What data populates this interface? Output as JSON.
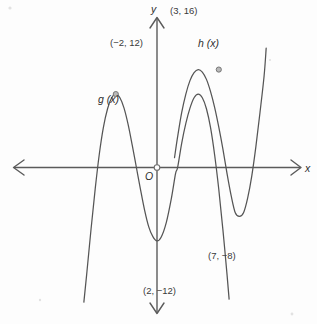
{
  "figure": {
    "kind": "cartesian-graph",
    "background_color": "#fdfdfd",
    "curve_color": "#555555",
    "axis_color": "#5b5b5b",
    "origin_label": "O",
    "x_axis_label": "x",
    "y_axis_label": "y"
  },
  "labels": {
    "g_function": "g (x)",
    "h_function": "h (x)",
    "g_max_point": "(−2, 12)",
    "h_max_point": "(3, 16)",
    "g_min_point": "(2, −12)",
    "h_min_point": "(7, −8)"
  },
  "chart_data": {
    "type": "line",
    "title": "",
    "xlabel": "x",
    "ylabel": "y",
    "grid": false,
    "legend": "inline-curve-labels",
    "xlim": [
      -6,
      10
    ],
    "ylim": [
      -24,
      24
    ],
    "origin_marker": "O",
    "annotations": [
      {
        "text": "(−2, 12)",
        "x": -2,
        "y": 12,
        "marker": true,
        "attached_to": "g (x)"
      },
      {
        "text": "(3, 16)",
        "x": 3,
        "y": 16,
        "marker": true,
        "attached_to": "h (x)"
      },
      {
        "text": "(2, −12)",
        "x": 2,
        "y": -12,
        "marker": false,
        "attached_to": "g (x)"
      },
      {
        "text": "(7, −8)",
        "x": 7,
        "y": -8,
        "marker": false,
        "attached_to": "h (x)"
      }
    ],
    "series": [
      {
        "name": "g (x)",
        "label_position": {
          "x": -4.2,
          "y": 7.5
        },
        "local_maximum": {
          "x": -2,
          "y": 12
        },
        "local_minimum": {
          "x": 2,
          "y": -12
        },
        "points": [
          [
            -3.55,
            -22.0
          ],
          [
            -3.4,
            -17.0
          ],
          [
            -3.2,
            -10.0
          ],
          [
            -3.0,
            -3.5
          ],
          [
            -2.8,
            2.2
          ],
          [
            -2.6,
            6.6
          ],
          [
            -2.4,
            9.6
          ],
          [
            -2.2,
            11.4
          ],
          [
            -2.0,
            12.0
          ],
          [
            -1.8,
            11.4
          ],
          [
            -1.6,
            9.7
          ],
          [
            -1.4,
            7.0
          ],
          [
            -1.2,
            3.6
          ],
          [
            -1.0,
            0.0
          ],
          [
            -0.8,
            -3.6
          ],
          [
            -0.6,
            -7.0
          ],
          [
            -0.4,
            -9.7
          ],
          [
            -0.2,
            -11.3
          ],
          [
            0.0,
            -12.0
          ],
          [
            0.2,
            -11.4
          ],
          [
            0.45,
            -9.0
          ],
          [
            0.7,
            -5.0
          ],
          [
            0.9,
            -1.0
          ],
          [
            1.0,
            0.0
          ],
          [
            1.2,
            4.0
          ],
          [
            1.4,
            7.2
          ],
          [
            1.6,
            9.7
          ],
          [
            1.8,
            11.4
          ],
          [
            2.0,
            12.0
          ],
          [
            2.2,
            11.4
          ],
          [
            2.4,
            9.6
          ],
          [
            2.6,
            6.5
          ],
          [
            2.8,
            2.0
          ],
          [
            3.0,
            -3.6
          ],
          [
            3.2,
            -10.2
          ],
          [
            3.4,
            -17.5
          ],
          [
            3.5,
            -21.5
          ]
        ]
      },
      {
        "name": "h (x)",
        "label_position": {
          "x": 4.4,
          "y": 18.5
        },
        "local_maximum": {
          "x": 3,
          "y": 16
        },
        "local_minimum": {
          "x": 7,
          "y": -8
        },
        "points": [
          [
            0.85,
            1.6
          ],
          [
            1.0,
            5.0
          ],
          [
            1.2,
            9.0
          ],
          [
            1.4,
            12.0
          ],
          [
            1.6,
            14.2
          ],
          [
            1.8,
            15.5
          ],
          [
            2.0,
            16.0
          ],
          [
            2.2,
            15.6
          ],
          [
            2.4,
            14.4
          ],
          [
            2.6,
            12.4
          ],
          [
            2.8,
            9.8
          ],
          [
            3.0,
            6.6
          ],
          [
            3.2,
            3.0
          ],
          [
            3.4,
            -1.0
          ],
          [
            3.6,
            -4.6
          ],
          [
            3.8,
            -7.4
          ],
          [
            4.0,
            -8.0
          ],
          [
            4.2,
            -7.4
          ],
          [
            4.4,
            -5.0
          ],
          [
            4.6,
            -1.4
          ],
          [
            4.8,
            3.4
          ],
          [
            5.0,
            9.0
          ],
          [
            5.2,
            15.0
          ],
          [
            5.3,
            19.5
          ]
        ]
      }
    ]
  }
}
